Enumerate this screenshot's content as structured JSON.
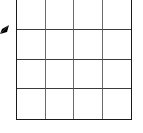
{
  "diagram": {
    "type": "grid",
    "rows": 4,
    "columns": 4,
    "cells": [
      [
        "",
        "",
        "",
        ""
      ],
      [
        "",
        "",
        "",
        ""
      ],
      [
        "",
        "",
        "",
        ""
      ],
      [
        "",
        "",
        "",
        ""
      ]
    ],
    "line_color": "#1a1a1a",
    "background": "#ffffff",
    "pointer": {
      "icon": "arrow-pointer-icon",
      "direction": "up-right",
      "color": "#000000",
      "position": "left edge, near first row boundary"
    }
  }
}
